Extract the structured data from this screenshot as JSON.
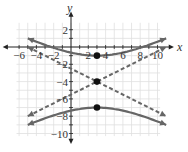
{
  "chart_data": {
    "type": "line",
    "title": "",
    "xlabel": "x",
    "ylabel": "y",
    "xlim": [
      -6,
      10
    ],
    "ylim": [
      -10,
      2
    ],
    "grid": true,
    "x_ticks": [
      "-6",
      "-4",
      "-2",
      "2",
      "4",
      "6",
      "8",
      "10"
    ],
    "y_ticks": [
      "2",
      "-2",
      "-4",
      "-6",
      "-8",
      "-10"
    ],
    "series": [
      {
        "name": "hyperbola upper branch",
        "style": "solid",
        "equation": "(y+4)^2/9 - (x-3)^2/36 = 1, y >= -1",
        "vertex": [
          3,
          -1
        ],
        "x": [
          -5,
          -3,
          -1,
          1,
          3,
          5,
          7,
          9,
          11
        ],
        "values": [
          1,
          -0.4,
          -0.39,
          -0.84,
          -1,
          -0.84,
          -0.39,
          0.24,
          1
        ]
      },
      {
        "name": "hyperbola lower branch",
        "style": "solid",
        "equation": "(y+4)^2/9 - (x-3)^2/36 = 1, y <= -7",
        "vertex": [
          3,
          -7
        ],
        "x": [
          -5,
          -3,
          -1,
          1,
          3,
          5,
          7,
          9,
          11
        ],
        "values": [
          -9,
          -8.24,
          -7.61,
          -7.16,
          -7,
          -7.16,
          -7.61,
          -8.24,
          -9
        ]
      },
      {
        "name": "asymptote 1",
        "style": "dashed",
        "equation": "y = -4 + (x-3)/2",
        "x": [
          -5,
          11
        ],
        "values": [
          -8,
          0
        ]
      },
      {
        "name": "asymptote 2",
        "style": "dashed",
        "equation": "y = -4 - (x-3)/2",
        "x": [
          -5,
          11
        ],
        "values": [
          0,
          -8
        ]
      }
    ],
    "points": [
      {
        "label": "vertex upper",
        "x": 3,
        "y": -1
      },
      {
        "label": "center",
        "x": 3,
        "y": -4
      },
      {
        "label": "vertex lower",
        "x": 3,
        "y": -7
      }
    ]
  },
  "axes": {
    "x_name": "x",
    "y_name": "y"
  },
  "colors": {
    "curve": "#666666",
    "grid": "#e0e0e0",
    "axis": "#222222",
    "point": "#111111"
  }
}
